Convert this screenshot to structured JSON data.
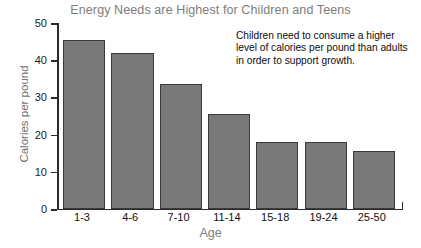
{
  "chart_data": {
    "type": "bar",
    "title": "Energy Needs are Highest for Children and Teens",
    "xlabel": "Age",
    "ylabel": "Calories per pound",
    "categories": [
      "1-3",
      "4-6",
      "7-10",
      "11-14",
      "15-18",
      "19-24",
      "25-50"
    ],
    "values": [
      45.5,
      42,
      33.5,
      25.5,
      18,
      18,
      15.5
    ],
    "ylim": [
      0,
      50
    ],
    "yticks": [
      0,
      10,
      20,
      30,
      40,
      50
    ],
    "ytick_labels": [
      "0",
      "10",
      "20",
      "30",
      "40",
      "50"
    ],
    "grid": false,
    "legend": "none",
    "annotations": [
      {
        "text": "Children need to consume a higher level of calories per pound than adults in order to support growth.",
        "position": "top-right"
      }
    ],
    "colors": {
      "bar_fill": "#787878",
      "bar_edge": "#3a3a3a",
      "axis": "#2b2b2b",
      "title_text": "#7d7d7d",
      "tick_text": "#101010",
      "annotation_text": "#0d0d0d",
      "background": "#ffffff"
    }
  },
  "labels": {
    "y0": "0",
    "y10": "10",
    "y20": "20",
    "y30": "30",
    "y40": "40",
    "y50": "50",
    "c0": "1-3",
    "c1": "4-6",
    "c2": "7-10",
    "c3": "11-14",
    "c4": "15-18",
    "c5": "19-24",
    "c6": "25-50"
  }
}
